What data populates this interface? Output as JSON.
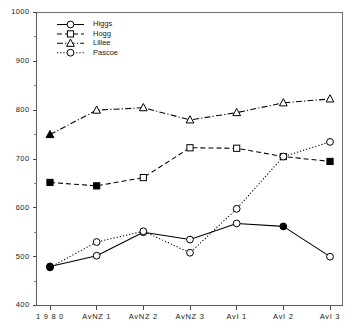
{
  "chart_data": {
    "type": "line",
    "title": "",
    "subtitle": "",
    "xlabel": "",
    "ylabel": "",
    "categories": [
      "1 9 8 0",
      "AvNZ 1",
      "AvNZ 2",
      "AvNZ 3",
      "AvI 1",
      "AvI 2",
      "AvI 3"
    ],
    "ylim": [
      400,
      1000
    ],
    "ytick_step": 100,
    "yminor_step": 50,
    "yticks": [
      400,
      500,
      600,
      700,
      800,
      900,
      1000
    ],
    "ytick_labels": [
      "400",
      "500",
      "600",
      "700",
      "800",
      "900",
      "1000"
    ],
    "grid": false,
    "legend_position": "top-left-inside",
    "series": [
      {
        "name": "Higgs",
        "marker": "circle",
        "linestyle": "solid",
        "values": [
          480,
          502,
          550,
          535,
          568,
          562,
          500
        ],
        "filled_points": [
          0,
          5
        ]
      },
      {
        "name": "Hogg",
        "marker": "square",
        "linestyle": "dashed",
        "values": [
          652,
          645,
          662,
          723,
          722,
          705,
          695
        ],
        "filled_points": [
          0,
          1,
          6
        ]
      },
      {
        "name": "Lillee",
        "marker": "triangle",
        "linestyle": "dashdot",
        "values": [
          750,
          800,
          805,
          780,
          795,
          815,
          823
        ],
        "filled_points": [
          0
        ]
      },
      {
        "name": "Pascoe",
        "marker": "circle",
        "linestyle": "dotted",
        "values": [
          478,
          530,
          552,
          508,
          598,
          705,
          735
        ],
        "filled_points": [
          0
        ]
      }
    ]
  },
  "colors": {
    "ink": "#000000",
    "axis": "#5a5a5a",
    "background": "#ffffff"
  }
}
